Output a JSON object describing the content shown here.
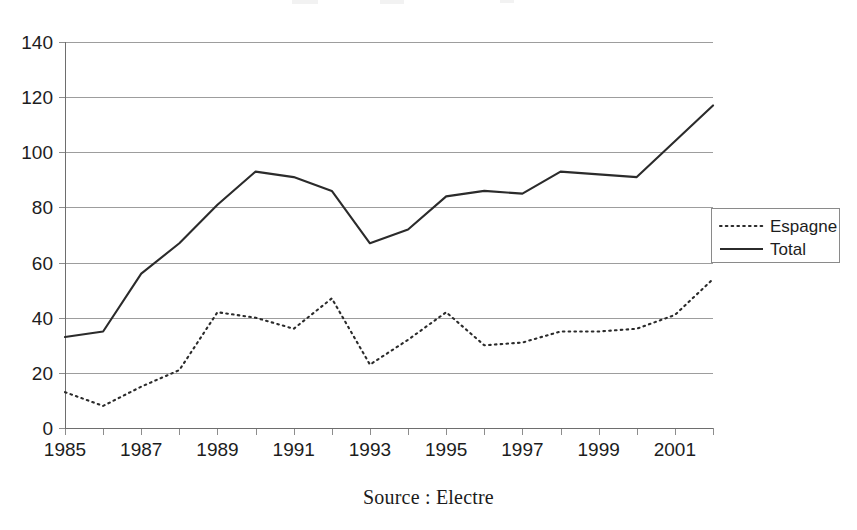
{
  "chart_data": {
    "type": "line",
    "title": "",
    "xlabel": "",
    "ylabel": "",
    "x": [
      1985,
      1986,
      1987,
      1988,
      1989,
      1990,
      1991,
      1992,
      1993,
      1994,
      1995,
      1996,
      1997,
      1998,
      1999,
      2000,
      2001,
      2002
    ],
    "xlim": [
      1985,
      2002
    ],
    "ylim": [
      0,
      140
    ],
    "grid": true,
    "legend_position": "right",
    "x_tick_labels": [
      "1985",
      "1987",
      "1989",
      "1991",
      "1993",
      "1995",
      "1997",
      "1999",
      "2001"
    ],
    "x_tick_values": [
      1985,
      1987,
      1989,
      1991,
      1993,
      1995,
      1997,
      1999,
      2001
    ],
    "y_tick_labels": [
      "0",
      "20",
      "40",
      "60",
      "80",
      "100",
      "120",
      "140"
    ],
    "y_tick_values": [
      0,
      20,
      40,
      60,
      80,
      100,
      120,
      140
    ],
    "series": [
      {
        "name": "Espagne",
        "style": "dotted",
        "color": "#2b2b2b",
        "values": [
          13,
          8,
          15,
          21,
          42,
          40,
          36,
          47,
          23,
          32,
          42,
          30,
          31,
          35,
          35,
          36,
          41,
          54
        ]
      },
      {
        "name": "Total",
        "style": "solid",
        "color": "#2b2b2b",
        "values": [
          33,
          35,
          56,
          67,
          81,
          93,
          91,
          86,
          67,
          72,
          84,
          86,
          85,
          93,
          92,
          91,
          104,
          117
        ]
      }
    ]
  },
  "legend": {
    "entries": [
      {
        "label": "Espagne",
        "style": "dotted"
      },
      {
        "label": "Total",
        "style": "solid"
      }
    ]
  },
  "footer": {
    "source_note": "Source : Electre"
  },
  "colors": {
    "line": "#2b2b2b",
    "gridline": "#9d9d9d",
    "axis": "#6e6e6e",
    "text": "#1d1d1d",
    "background": "#ffffff"
  }
}
